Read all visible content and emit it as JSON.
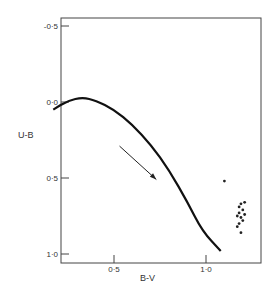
{
  "chart_data": {
    "type": "scatter",
    "title": "",
    "xlabel": "B-V",
    "ylabel": "U-B",
    "xlim": [
      0.12,
      1.23
    ],
    "ylim": [
      1.05,
      -0.6
    ],
    "y_inverted": true,
    "grid": false,
    "x_ticks": [
      {
        "value": 0.5,
        "label": "0·5"
      },
      {
        "value": 1.0,
        "label": "1·0"
      }
    ],
    "y_ticks": [
      {
        "value": -0.5,
        "label": "-0·5"
      },
      {
        "value": 0.0,
        "label": "0·0"
      },
      {
        "value": 0.5,
        "label": "0·5"
      },
      {
        "value": 1.0,
        "label": "1·0"
      }
    ],
    "series": [
      {
        "name": "main-sequence-curve",
        "kind": "line",
        "points": [
          [
            0.17,
            0.05
          ],
          [
            0.25,
            -0.01
          ],
          [
            0.33,
            -0.03
          ],
          [
            0.4,
            -0.01
          ],
          [
            0.5,
            0.05
          ],
          [
            0.6,
            0.15
          ],
          [
            0.7,
            0.28
          ],
          [
            0.8,
            0.45
          ],
          [
            0.9,
            0.66
          ],
          [
            0.98,
            0.85
          ],
          [
            1.08,
            0.98
          ]
        ]
      },
      {
        "name": "reddening-vector",
        "kind": "arrow",
        "from": [
          0.53,
          0.29
        ],
        "to": [
          0.73,
          0.51
        ]
      },
      {
        "name": "stars",
        "kind": "scatter",
        "points": [
          [
            1.1,
            0.52
          ],
          [
            1.19,
            0.67
          ],
          [
            1.21,
            0.66
          ],
          [
            1.18,
            0.69
          ],
          [
            1.2,
            0.71
          ],
          [
            1.18,
            0.73
          ],
          [
            1.21,
            0.74
          ],
          [
            1.17,
            0.75
          ],
          [
            1.19,
            0.76
          ],
          [
            1.2,
            0.78
          ],
          [
            1.18,
            0.8
          ],
          [
            1.17,
            0.82
          ],
          [
            1.19,
            0.86
          ]
        ]
      }
    ]
  }
}
